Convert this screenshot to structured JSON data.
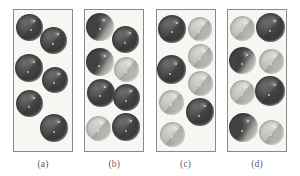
{
  "figure": {
    "kind": "packing-diagram",
    "background_color": "#ffffff",
    "panel_fill_color": "#f7f6f3",
    "panel_border_color": "#8a8a8a",
    "label_color": "#5e5e5e",
    "sphere_dark_color": "#3a3a3a",
    "sphere_light_color": "#c3c1bd",
    "panel_count": 4
  },
  "panels": [
    {
      "label": "(a)",
      "name": "panel-a",
      "spheres": [
        {
          "x": 2,
          "y": 4,
          "d": 27,
          "shade": "dark",
          "spec": [
            [
              17,
              6
            ],
            [
              14,
              15
            ]
          ]
        },
        {
          "x": 26,
          "y": 17,
          "d": 27,
          "shade": "dark",
          "spec": [
            [
              17,
              6
            ],
            [
              12,
              16
            ]
          ]
        },
        {
          "x": 1,
          "y": 44,
          "d": 28,
          "shade": "dark",
          "spec": [
            [
              18,
              7
            ],
            [
              12,
              17
            ]
          ]
        },
        {
          "x": 28,
          "y": 57,
          "d": 26,
          "shade": "dark",
          "spec": [
            [
              16,
              6
            ],
            [
              11,
              15
            ]
          ]
        },
        {
          "x": 2,
          "y": 80,
          "d": 27,
          "shade": "dark",
          "spec": [
            [
              17,
              7
            ],
            [
              12,
              16
            ]
          ]
        },
        {
          "x": 26,
          "y": 104,
          "d": 28,
          "shade": "dark",
          "spec": [
            [
              18,
              7
            ],
            [
              13,
              17
            ]
          ]
        }
      ]
    },
    {
      "label": "(b)",
      "name": "panel-b",
      "spheres": [
        {
          "x": 1,
          "y": 3,
          "d": 28,
          "shade": "mid",
          "spec": [
            [
              17,
              6
            ],
            [
              13,
              15
            ]
          ]
        },
        {
          "x": 27,
          "y": 16,
          "d": 27,
          "shade": "dark",
          "spec": [
            [
              17,
              6
            ],
            [
              12,
              16
            ]
          ]
        },
        {
          "x": 1,
          "y": 38,
          "d": 28,
          "shade": "mid",
          "spec": [
            [
              18,
              7
            ],
            [
              12,
              17
            ]
          ]
        },
        {
          "x": 29,
          "y": 47,
          "d": 25,
          "shade": "light",
          "spec": [
            [
              15,
              6
            ],
            [
              11,
              14
            ]
          ]
        },
        {
          "x": 2,
          "y": 69,
          "d": 28,
          "shade": "dark",
          "spec": [
            [
              17,
              7
            ],
            [
              12,
              16
            ]
          ]
        },
        {
          "x": 28,
          "y": 74,
          "d": 27,
          "shade": "dark",
          "spec": [
            [
              17,
              6
            ],
            [
              12,
              16
            ]
          ]
        },
        {
          "x": 1,
          "y": 106,
          "d": 25,
          "shade": "light",
          "spec": [
            [
              15,
              6
            ],
            [
              11,
              14
            ]
          ]
        },
        {
          "x": 27,
          "y": 103,
          "d": 28,
          "shade": "dark",
          "spec": [
            [
              18,
              7
            ],
            [
              13,
              17
            ]
          ]
        }
      ]
    },
    {
      "label": "(c)",
      "name": "panel-c",
      "spheres": [
        {
          "x": 1,
          "y": 5,
          "d": 28,
          "shade": "dark",
          "spec": [
            [
              18,
              7
            ],
            [
              13,
              16
            ]
          ]
        },
        {
          "x": 31,
          "y": 7,
          "d": 24,
          "shade": "light",
          "spec": [
            [
              14,
              6
            ],
            [
              10,
              14
            ]
          ]
        },
        {
          "x": 31,
          "y": 34,
          "d": 25,
          "shade": "light",
          "spec": [
            [
              15,
              6
            ],
            [
              11,
              14
            ]
          ]
        },
        {
          "x": 0,
          "y": 45,
          "d": 29,
          "shade": "dark",
          "spec": [
            [
              18,
              8
            ],
            [
              12,
              18
            ]
          ]
        },
        {
          "x": 31,
          "y": 61,
          "d": 25,
          "shade": "light",
          "spec": [
            [
              15,
              6
            ],
            [
              11,
              14
            ]
          ]
        },
        {
          "x": 2,
          "y": 80,
          "d": 25,
          "shade": "light",
          "spec": [
            [
              15,
              6
            ],
            [
              11,
              14
            ]
          ]
        },
        {
          "x": 29,
          "y": 88,
          "d": 28,
          "shade": "dark",
          "spec": [
            [
              18,
              7
            ],
            [
              12,
              17
            ]
          ]
        },
        {
          "x": 3,
          "y": 112,
          "d": 25,
          "shade": "light",
          "spec": [
            [
              15,
              6
            ],
            [
              11,
              14
            ]
          ]
        }
      ]
    },
    {
      "label": "(d)",
      "name": "panel-d",
      "spheres": [
        {
          "x": 2,
          "y": 6,
          "d": 25,
          "shade": "light",
          "spec": [
            [
              15,
              6
            ],
            [
              11,
              14
            ]
          ]
        },
        {
          "x": 28,
          "y": 3,
          "d": 29,
          "shade": "dark",
          "spec": [
            [
              18,
              7
            ],
            [
              13,
              17
            ]
          ]
        },
        {
          "x": 1,
          "y": 37,
          "d": 27,
          "shade": "mid",
          "spec": [
            [
              17,
              7
            ],
            [
              12,
              16
            ]
          ]
        },
        {
          "x": 31,
          "y": 39,
          "d": 25,
          "shade": "light",
          "spec": [
            [
              15,
              6
            ],
            [
              11,
              14
            ]
          ]
        },
        {
          "x": 2,
          "y": 70,
          "d": 25,
          "shade": "light",
          "spec": [
            [
              15,
              6
            ],
            [
              11,
              14
            ]
          ]
        },
        {
          "x": 27,
          "y": 66,
          "d": 30,
          "shade": "dark",
          "spec": [
            [
              19,
              8
            ],
            [
              13,
              18
            ]
          ]
        },
        {
          "x": 1,
          "y": 103,
          "d": 29,
          "shade": "mid",
          "spec": [
            [
              18,
              7
            ],
            [
              12,
              17
            ]
          ]
        },
        {
          "x": 31,
          "y": 110,
          "d": 25,
          "shade": "light",
          "spec": [
            [
              15,
              6
            ],
            [
              11,
              14
            ]
          ]
        }
      ]
    }
  ]
}
